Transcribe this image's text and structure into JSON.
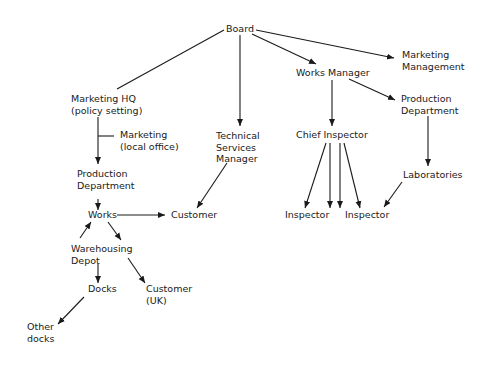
{
  "diagram": {
    "type": "organisation-flow",
    "colors": {
      "ink": "#1a1a1a",
      "background": "#ffffff"
    },
    "nodes": [
      {
        "id": "board",
        "lines": [
          "Board"
        ],
        "x": 226,
        "y": 32
      },
      {
        "id": "marketing_management",
        "lines": [
          "Marketing",
          "Management"
        ],
        "x": 402,
        "y": 58
      },
      {
        "id": "works_manager",
        "lines": [
          "Works Manager"
        ],
        "x": 296,
        "y": 76
      },
      {
        "id": "marketing_hq",
        "lines": [
          "Marketing HQ",
          "(policy setting)"
        ],
        "x": 71,
        "y": 102
      },
      {
        "id": "production_department_right",
        "lines": [
          "Production",
          "Department"
        ],
        "x": 401,
        "y": 102
      },
      {
        "id": "marketing_local",
        "lines": [
          "Marketing",
          "(local office)"
        ],
        "x": 120,
        "y": 138
      },
      {
        "id": "technical_services_manager",
        "lines": [
          "Technical",
          "Services",
          "Manager"
        ],
        "x": 216,
        "y": 139
      },
      {
        "id": "chief_inspector",
        "lines": [
          "Chief Inspector"
        ],
        "x": 296,
        "y": 138
      },
      {
        "id": "production_department_left",
        "lines": [
          "Production",
          "Department"
        ],
        "x": 77,
        "y": 177
      },
      {
        "id": "laboratories",
        "lines": [
          "Laboratories"
        ],
        "x": 403,
        "y": 178
      },
      {
        "id": "works",
        "lines": [
          "Works"
        ],
        "x": 88,
        "y": 218
      },
      {
        "id": "customer",
        "lines": [
          "Customer"
        ],
        "x": 171,
        "y": 218
      },
      {
        "id": "inspector_1",
        "lines": [
          "Inspector"
        ],
        "x": 285,
        "y": 218
      },
      {
        "id": "inspector_2",
        "lines": [
          "Inspector"
        ],
        "x": 345,
        "y": 218
      },
      {
        "id": "warehousing_depot",
        "lines": [
          "Warehousing",
          "Depot"
        ],
        "x": 71,
        "y": 252
      },
      {
        "id": "docks",
        "lines": [
          "Docks"
        ],
        "x": 88,
        "y": 292
      },
      {
        "id": "customer_uk",
        "lines": [
          "Customer",
          "(UK)"
        ],
        "x": 146,
        "y": 292
      },
      {
        "id": "other_docks",
        "lines": [
          "Other",
          "docks"
        ],
        "x": 27,
        "y": 330
      }
    ],
    "edges": [
      {
        "from": "board",
        "to": "marketing_hq",
        "x1": 224,
        "y1": 30,
        "x2": 117,
        "y2": 89,
        "arrow": false
      },
      {
        "from": "board",
        "to": "technical_services_manager",
        "x1": 240,
        "y1": 35,
        "x2": 240,
        "y2": 126,
        "arrow": true
      },
      {
        "from": "board",
        "to": "works_manager",
        "x1": 252,
        "y1": 34,
        "x2": 316,
        "y2": 64,
        "arrow": true
      },
      {
        "from": "board",
        "to": "marketing_management",
        "x1": 256,
        "y1": 30,
        "x2": 394,
        "y2": 58,
        "arrow": true
      },
      {
        "from": "works_manager",
        "to": "chief_inspector",
        "x1": 332,
        "y1": 80,
        "x2": 332,
        "y2": 126,
        "arrow": true
      },
      {
        "from": "works_manager",
        "to": "production_department_right",
        "x1": 349,
        "y1": 79,
        "x2": 395,
        "y2": 100,
        "arrow": true
      },
      {
        "from": "production_department_right",
        "to": "laboratories",
        "x1": 428,
        "y1": 116,
        "x2": 428,
        "y2": 166,
        "arrow": true
      },
      {
        "from": "marketing_hq",
        "to": "production_department_left",
        "x1": 98,
        "y1": 117,
        "x2": 98,
        "y2": 164,
        "arrow": true
      },
      {
        "from": "marketing_hq",
        "to": "marketing_local",
        "x1": 98,
        "y1": 136,
        "x2": 114,
        "y2": 136,
        "arrow": false
      },
      {
        "from": "production_department_left",
        "to": "works",
        "x1": 98,
        "y1": 199,
        "x2": 98,
        "y2": 210,
        "arrow": true
      },
      {
        "from": "works",
        "to": "customer",
        "x1": 117,
        "y1": 215,
        "x2": 165,
        "y2": 215,
        "arrow": true
      },
      {
        "from": "technical_services_manager",
        "to": "customer",
        "x1": 227,
        "y1": 163,
        "x2": 197,
        "y2": 208,
        "arrow": true
      },
      {
        "from": "warehousing_depot",
        "to": "works",
        "x1": 80,
        "y1": 238,
        "x2": 91,
        "y2": 222,
        "arrow": true
      },
      {
        "from": "works",
        "to": "warehousing_depot",
        "x1": 108,
        "y1": 222,
        "x2": 121,
        "y2": 240,
        "arrow": true
      },
      {
        "from": "warehousing_depot",
        "to": "docks",
        "x1": 98,
        "y1": 264,
        "x2": 98,
        "y2": 283,
        "arrow": true
      },
      {
        "from": "warehousing_depot",
        "to": "customer_uk",
        "x1": 128,
        "y1": 258,
        "x2": 145,
        "y2": 283,
        "arrow": true
      },
      {
        "from": "docks",
        "to": "other_docks",
        "x1": 84,
        "y1": 297,
        "x2": 58,
        "y2": 324,
        "arrow": true
      },
      {
        "from": "chief_inspector",
        "to": "inspector_1",
        "x1": 326,
        "y1": 143,
        "x2": 305,
        "y2": 208,
        "arrow": true
      },
      {
        "from": "chief_inspector",
        "to": "inspector_1",
        "x1": 330,
        "y1": 143,
        "x2": 330,
        "y2": 208,
        "arrow": true
      },
      {
        "from": "chief_inspector",
        "to": "inspector_2",
        "x1": 340,
        "y1": 143,
        "x2": 340,
        "y2": 208,
        "arrow": true
      },
      {
        "from": "chief_inspector",
        "to": "inspector_2",
        "x1": 344,
        "y1": 143,
        "x2": 360,
        "y2": 208,
        "arrow": true
      },
      {
        "from": "laboratories",
        "to": "inspector_2",
        "x1": 402,
        "y1": 182,
        "x2": 384,
        "y2": 207,
        "arrow": true
      }
    ]
  }
}
